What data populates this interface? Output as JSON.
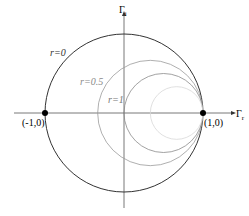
{
  "diagram": {
    "axes": {
      "horizontal_label": "Γr",
      "vertical_label": "Γi",
      "horizontal_main": "Γ",
      "horizontal_sub": "r",
      "vertical_main": "Γ",
      "vertical_sub": "i"
    },
    "points": [
      {
        "label": "(-1,0)",
        "gamma_r": -1,
        "gamma_i": 0
      },
      {
        "label": "(1,0)",
        "gamma_r": 1,
        "gamma_i": 0
      }
    ],
    "circles": [
      {
        "r": 0,
        "label": "r=0",
        "center": 0,
        "radius": 1,
        "color": "#333333",
        "opacity": 1
      },
      {
        "r": 0.5,
        "label": "r=0.5",
        "center": 0.3333,
        "radius": 0.6667,
        "color": "#9a9a9a",
        "opacity": 1
      },
      {
        "r": 1,
        "label": "r=1",
        "center": 0.5,
        "radius": 0.5,
        "color": "#8a8a8a",
        "opacity": 1
      },
      {
        "r": 2,
        "label": "",
        "center": 0.6667,
        "radius": 0.3333,
        "color": "#d8d8d8",
        "opacity": 1
      }
    ]
  }
}
